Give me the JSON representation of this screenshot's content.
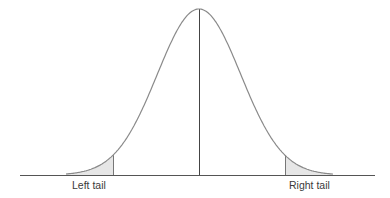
{
  "diagram": {
    "type": "normal-distribution",
    "labels": {
      "left_tail": "Left tail",
      "right_tail": "Right tail"
    },
    "colors": {
      "curve": "#8a8a8a",
      "axis": "#555555",
      "center_line": "#444444",
      "tail_fill": "#e6e6e6",
      "tail_edge": "#777777",
      "text": "#3a3a3a"
    },
    "geometry": {
      "baseline_y": 175,
      "axis_x_start": 20,
      "axis_x_end": 375,
      "peak_x": 199,
      "peak_y": 9,
      "curve_x_start": 66,
      "curve_x_end": 333,
      "left_cut_x": 113,
      "right_cut_x": 285
    }
  }
}
